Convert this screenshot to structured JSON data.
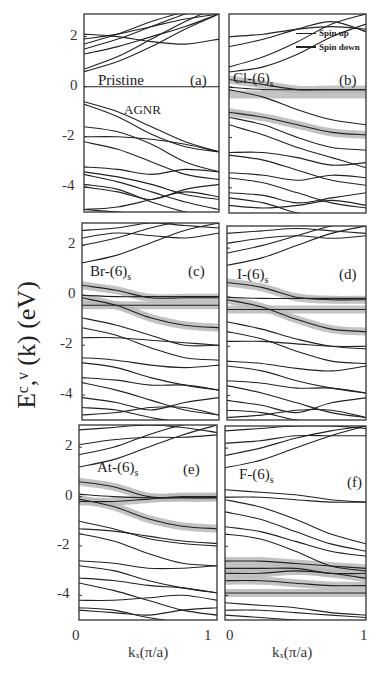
{
  "chart_data": {
    "type": "line",
    "title": "",
    "ylabel": "E^{c,v}(k) (eV)",
    "xlabel": "k_x(π/a)",
    "xlim": [
      0,
      1
    ],
    "ylim": [
      -5,
      2.9
    ],
    "xticks": [
      "0",
      "1"
    ],
    "yticks": [
      "2",
      "0",
      "-2",
      "-4"
    ],
    "legend": {
      "position": "upper-right of panel (b)",
      "entries": [
        "Spin up",
        "Spin down"
      ]
    },
    "panels": [
      {
        "id": "a",
        "label": "(a)",
        "title": "Pristine",
        "subtitle": "AGNR",
        "highlight": false,
        "bands": [
          [
            0.6,
            1.0,
            1.6,
            2.3,
            2.9
          ],
          [
            0.7,
            1.2,
            1.9,
            2.6,
            3.2
          ],
          [
            1.3,
            1.6,
            2.0,
            2.4,
            2.9
          ],
          [
            1.5,
            1.9,
            2.4,
            2.9,
            3.3
          ],
          [
            1.7,
            2.1,
            2.6,
            3.0,
            3.4
          ],
          [
            2.1,
            2.0,
            1.8,
            1.7,
            1.9
          ],
          [
            1.9,
            2.1,
            2.4,
            2.7,
            2.9
          ],
          [
            -0.6,
            -1.0,
            -1.6,
            -2.2,
            -2.6
          ],
          [
            -0.7,
            -1.2,
            -1.9,
            -2.4,
            -2.6
          ],
          [
            -1.6,
            -1.8,
            -2.3,
            -3.0,
            -3.4
          ],
          [
            -2.0,
            -2.0,
            -2.1,
            -2.3,
            -2.6
          ],
          [
            -2.2,
            -2.5,
            -3.0,
            -3.5,
            -3.7
          ],
          [
            -3.2,
            -3.3,
            -3.5,
            -3.3,
            -3.4
          ],
          [
            -3.4,
            -3.6,
            -3.9,
            -4.3,
            -4.5
          ],
          [
            -3.5,
            -3.8,
            -4.2,
            -4.6,
            -4.9
          ],
          [
            -3.9,
            -4.1,
            -4.6,
            -5.0,
            -5.2
          ],
          [
            -4.0,
            -4.2,
            -4.5,
            -4.1,
            -3.9
          ],
          [
            -4.9,
            -4.8,
            -4.5,
            -4.2,
            -4.4
          ],
          [
            -4.9,
            -5.0,
            -5.1,
            -5.2,
            -5.3
          ]
        ]
      },
      {
        "id": "b",
        "label": "(b)",
        "title": "Cl-(6)s",
        "highlight": true,
        "highlight_bands": [
          [
            0.3,
            0.1,
            -0.1,
            -0.1,
            -0.1
          ],
          [
            -0.3,
            -0.3,
            -0.3,
            -0.3,
            -0.3
          ],
          [
            -1.0,
            -1.2,
            -1.5,
            -1.8,
            -1.9
          ]
        ],
        "bands": [
          [
            0.6,
            0.8,
            1.3,
            2.0,
            2.5
          ],
          [
            0.8,
            1.2,
            1.8,
            2.5,
            2.9
          ],
          [
            1.6,
            1.9,
            2.3,
            2.6,
            2.2
          ],
          [
            2.0,
            2.1,
            2.3,
            2.4,
            2.3
          ],
          [
            0.3,
            0.1,
            -0.1,
            -0.1,
            -0.1
          ],
          [
            0.0,
            -0.1,
            -0.1,
            -0.1,
            -0.1
          ],
          [
            -0.1,
            -0.4,
            -0.9,
            -1.3,
            -1.5
          ],
          [
            -1.0,
            -1.2,
            -1.5,
            -1.8,
            -1.9
          ],
          [
            -1.2,
            -1.5,
            -2.0,
            -2.4,
            -2.5
          ],
          [
            -1.5,
            -1.9,
            -2.4,
            -2.8,
            -3.2
          ],
          [
            -2.6,
            -2.6,
            -2.8,
            -3.1,
            -3.0
          ],
          [
            -2.7,
            -2.9,
            -3.3,
            -3.7,
            -3.9
          ],
          [
            -3.4,
            -3.5,
            -3.7,
            -3.5,
            -3.6
          ],
          [
            -3.6,
            -3.8,
            -4.2,
            -4.6,
            -4.8
          ],
          [
            -4.2,
            -4.3,
            -4.6,
            -4.4,
            -4.2
          ],
          [
            -4.4,
            -4.6,
            -5.0,
            -5.2,
            -5.3
          ],
          [
            -4.7,
            -4.8,
            -4.7,
            -4.5,
            -4.7
          ]
        ]
      },
      {
        "id": "c",
        "label": "(c)",
        "title": "Br-(6)s",
        "highlight": true,
        "highlight_bands": [
          [
            0.4,
            0.2,
            -0.1,
            -0.1,
            -0.1
          ],
          [
            -0.4,
            -0.4,
            -0.4,
            -0.4,
            -0.4
          ],
          [
            -0.1,
            -0.4,
            -0.9,
            -1.2,
            -1.3
          ]
        ],
        "bands": [
          [
            1.3,
            1.6,
            2.1,
            2.6,
            2.9
          ],
          [
            2.0,
            2.3,
            2.7,
            3.0,
            3.2
          ],
          [
            2.3,
            2.5,
            2.4,
            2.3,
            2.5
          ],
          [
            2.6,
            2.7,
            2.9,
            2.8,
            2.7
          ],
          [
            0.4,
            0.2,
            -0.1,
            -0.1,
            -0.1
          ],
          [
            0.0,
            -0.05,
            -0.05,
            -0.05,
            -0.05
          ],
          [
            -0.1,
            -0.4,
            -0.9,
            -1.2,
            -1.3
          ],
          [
            -0.4,
            -0.4,
            -0.4,
            -0.4,
            -0.4
          ],
          [
            -0.9,
            -1.2,
            -1.6,
            -2.0,
            -2.0
          ],
          [
            -1.3,
            -1.6,
            -2.1,
            -2.5,
            -2.6
          ],
          [
            -1.7,
            -1.7,
            -1.8,
            -1.9,
            -2.0
          ],
          [
            -2.5,
            -2.6,
            -2.8,
            -2.9,
            -2.8
          ],
          [
            -2.7,
            -2.9,
            -3.3,
            -3.6,
            -3.8
          ],
          [
            -3.3,
            -3.4,
            -3.6,
            -3.6,
            -3.8
          ],
          [
            -3.5,
            -3.8,
            -4.2,
            -4.6,
            -4.8
          ],
          [
            -4.1,
            -4.3,
            -4.6,
            -4.3,
            -4.1
          ],
          [
            -4.5,
            -4.6,
            -4.9,
            -5.1,
            -5.2
          ],
          [
            -4.8,
            -4.7,
            -4.5,
            -4.5,
            -4.8
          ]
        ]
      },
      {
        "id": "d",
        "label": "(d)",
        "title": "I-(6)s",
        "highlight": true,
        "highlight_bands": [
          [
            0.6,
            0.4,
            0.0,
            -0.1,
            -0.1
          ],
          [
            -0.5,
            -0.5,
            -0.5,
            -0.5,
            -0.5
          ],
          [
            -0.1,
            -0.4,
            -0.9,
            -1.3,
            -1.4
          ]
        ],
        "bands": [
          [
            1.3,
            1.6,
            2.1,
            2.6,
            2.9
          ],
          [
            1.8,
            2.1,
            2.5,
            2.9,
            3.1
          ],
          [
            2.2,
            2.4,
            2.5,
            2.4,
            2.5
          ],
          [
            2.6,
            2.7,
            2.8,
            2.7,
            2.6
          ],
          [
            0.6,
            0.4,
            0.0,
            -0.1,
            -0.1
          ],
          [
            0.0,
            -0.05,
            -0.05,
            -0.05,
            -0.05
          ],
          [
            -0.1,
            -0.4,
            -0.9,
            -1.3,
            -1.4
          ],
          [
            -0.5,
            -0.5,
            -0.5,
            -0.5,
            -0.5
          ],
          [
            -1.0,
            -1.3,
            -1.7,
            -2.0,
            -2.1
          ],
          [
            -1.4,
            -1.7,
            -2.2,
            -2.6,
            -2.7
          ],
          [
            -1.8,
            -1.8,
            -1.9,
            -2.0,
            -2.0
          ],
          [
            -2.6,
            -2.7,
            -2.9,
            -3.0,
            -2.8
          ],
          [
            -2.8,
            -3.0,
            -3.4,
            -3.7,
            -3.9
          ],
          [
            -3.4,
            -3.5,
            -3.7,
            -3.7,
            -3.9
          ],
          [
            -3.6,
            -3.9,
            -4.3,
            -4.7,
            -4.9
          ],
          [
            -4.2,
            -4.4,
            -4.7,
            -4.3,
            -4.1
          ],
          [
            -4.6,
            -4.7,
            -5.0,
            -5.1,
            -5.2
          ],
          [
            -4.9,
            -4.8,
            -4.6,
            -4.6,
            -4.9
          ]
        ]
      },
      {
        "id": "e",
        "label": "(e)",
        "title": "At-(6)s",
        "highlight": true,
        "highlight_bands": [
          [
            0.6,
            0.4,
            0.0,
            -0.05,
            -0.05
          ],
          [
            -0.2,
            -0.2,
            -0.1,
            0.0,
            0.0
          ],
          [
            -0.1,
            -0.4,
            -0.9,
            -1.2,
            -1.3
          ]
        ],
        "bands": [
          [
            1.2,
            1.5,
            2.0,
            2.5,
            2.9
          ],
          [
            1.7,
            2.0,
            2.5,
            2.9,
            3.1
          ],
          [
            2.1,
            2.3,
            2.4,
            2.4,
            2.5
          ],
          [
            2.7,
            2.8,
            2.9,
            2.8,
            2.6
          ],
          [
            0.6,
            0.4,
            0.0,
            -0.05,
            -0.05
          ],
          [
            0.1,
            0.0,
            -0.05,
            -0.05,
            -0.05
          ],
          [
            -0.1,
            -0.4,
            -0.9,
            -1.2,
            -1.3
          ],
          [
            -0.2,
            -0.2,
            -0.1,
            0.0,
            0.0
          ],
          [
            -1.3,
            -1.4,
            -1.6,
            -1.8,
            -1.9
          ],
          [
            -1.5,
            -1.8,
            -2.3,
            -2.7,
            -2.8
          ],
          [
            -1.0,
            -1.3,
            -1.7,
            -1.9,
            -2.0
          ],
          [
            -2.6,
            -2.7,
            -2.9,
            -2.9,
            -2.8
          ],
          [
            -2.8,
            -3.0,
            -3.4,
            -3.7,
            -3.9
          ],
          [
            -3.3,
            -3.4,
            -3.6,
            -3.7,
            -3.9
          ],
          [
            -3.5,
            -3.8,
            -4.2,
            -4.6,
            -4.8
          ],
          [
            -4.2,
            -4.2,
            -4.1,
            -4.0,
            -4.2
          ],
          [
            -4.5,
            -4.6,
            -4.9,
            -5.1,
            -5.2
          ],
          [
            -4.6,
            -4.7,
            -4.8,
            -4.6,
            -4.5
          ]
        ]
      },
      {
        "id": "f",
        "label": "(f)",
        "title": "F-(6)s",
        "highlight": true,
        "highlight_bands": [
          [
            -2.6,
            -2.6,
            -2.7,
            -2.8,
            -2.9
          ],
          [
            -2.9,
            -2.9,
            -2.9,
            -3.1,
            -3.1
          ],
          [
            -3.1,
            -3.1,
            -3.0,
            -3.1,
            -3.3
          ],
          [
            -3.4,
            -3.4,
            -3.5,
            -3.6,
            -3.6
          ],
          [
            -3.9,
            -3.9,
            -3.9,
            -3.9,
            -3.9
          ]
        ],
        "bands": [
          [
            1.2,
            1.5,
            2.0,
            2.5,
            2.9
          ],
          [
            1.7,
            2.0,
            2.4,
            2.7,
            2.9
          ],
          [
            2.2,
            2.3,
            2.5,
            2.5,
            2.5
          ],
          [
            2.7,
            2.8,
            2.9,
            2.9,
            2.8
          ],
          [
            0.3,
            0.2,
            0.1,
            -0.1,
            -0.2
          ],
          [
            0.0,
            0.0,
            -0.1,
            -0.2,
            -0.2
          ],
          [
            -0.1,
            -0.4,
            -0.9,
            -1.5,
            -1.9
          ],
          [
            -0.6,
            -0.9,
            -1.4,
            -1.9,
            -2.2
          ],
          [
            -1.2,
            -1.4,
            -1.8,
            -2.2,
            -2.4
          ],
          [
            -1.5,
            -1.7,
            -2.2,
            -2.8,
            -3.0
          ],
          [
            -2.6,
            -2.6,
            -2.7,
            -2.8,
            -2.9
          ],
          [
            -2.9,
            -2.9,
            -2.9,
            -3.1,
            -3.1
          ],
          [
            -3.1,
            -3.1,
            -3.0,
            -3.1,
            -3.3
          ],
          [
            -3.4,
            -3.4,
            -3.5,
            -3.6,
            -3.6
          ],
          [
            -3.9,
            -3.9,
            -3.9,
            -3.9,
            -3.9
          ],
          [
            -4.3,
            -4.4,
            -4.5,
            -4.7,
            -4.8
          ],
          [
            -4.6,
            -4.6,
            -4.7,
            -4.8,
            -4.9
          ],
          [
            -4.8,
            -4.9,
            -5.0,
            -5.1,
            -5.2
          ]
        ]
      }
    ]
  },
  "figure": {
    "ylabel_text": "Eᶜ,ᵛ (k) (eV)",
    "xlabel_text": "kₓ(π/a)",
    "legend": {
      "spin_up": "Spin up",
      "spin_down": "Spin down"
    },
    "panel_titles": {
      "a": "Pristine",
      "a_sub": "AGNR",
      "b": "Cl-(6)",
      "c": "Br-(6)",
      "d": "I-(6)",
      "e": "At-(6)",
      "f": "F-(6)"
    },
    "subscript": "s",
    "panel_letters": {
      "a": "(a)",
      "b": "(b)",
      "c": "(c)",
      "d": "(d)",
      "e": "(e)",
      "f": "(f)"
    },
    "yticks": [
      "2",
      "0",
      "-2",
      "-4"
    ],
    "xticks": [
      "0",
      "1"
    ],
    "colors": {
      "line": "#222222",
      "highlight": "#b8b8b8",
      "frame": "#333333"
    }
  }
}
